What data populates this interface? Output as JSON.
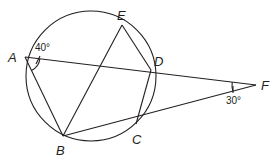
{
  "diagram": {
    "type": "circle-secants",
    "stroke_color": "#231f20",
    "background": "#ffffff",
    "circle": {
      "cx": 91,
      "cy": 76,
      "r": 65
    },
    "points": {
      "A": {
        "label": "A",
        "x": 25,
        "y": 57
      },
      "B": {
        "label": "B",
        "x": 63,
        "y": 136
      },
      "C": {
        "label": "C",
        "x": 136,
        "y": 124
      },
      "D": {
        "label": "D",
        "x": 151,
        "y": 70
      },
      "E": {
        "label": "E",
        "x": 122,
        "y": 25
      },
      "F": {
        "label": "F",
        "x": 256,
        "y": 85
      }
    },
    "segments": [
      [
        "A",
        "F"
      ],
      [
        "B",
        "F"
      ],
      [
        "A",
        "B"
      ],
      [
        "B",
        "E"
      ],
      [
        "E",
        "D"
      ],
      [
        "D",
        "C"
      ]
    ],
    "angles": {
      "A": {
        "label": "40°",
        "vertex": "A"
      },
      "F": {
        "label": "30°",
        "vertex": "F"
      }
    }
  }
}
